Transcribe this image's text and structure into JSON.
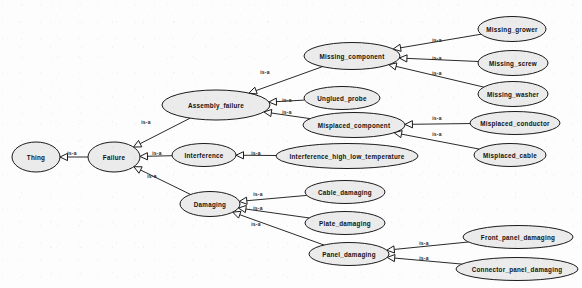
{
  "diagram": {
    "type": "is-a hierarchy graph",
    "background_color": "#fdfdfd",
    "node_fill_color": "#ebebeb",
    "node_stroke_color": "#1b1b1b",
    "edge_color": "#2a2a2a",
    "edge_label_text": "is-a",
    "nodes": [
      {
        "id": "thing",
        "label": "Thing",
        "cx": 36,
        "cy": 157,
        "rx": 24,
        "ry": 15
      },
      {
        "id": "failure",
        "label": "Failure",
        "cx": 114,
        "cy": 157,
        "rx": 26,
        "ry": 15
      },
      {
        "id": "assembly_failure",
        "label": "Assembly_failure",
        "cx": 216,
        "cy": 105,
        "rx": 54,
        "ry": 15
      },
      {
        "id": "interference",
        "label": "Interference",
        "cx": 204,
        "cy": 155,
        "rx": 32,
        "ry": 11.5
      },
      {
        "id": "damaging",
        "label": "Damaging",
        "cx": 210,
        "cy": 204,
        "rx": 30,
        "ry": 12.5
      },
      {
        "id": "missing_component",
        "label": "Missing_component",
        "cx": 352,
        "cy": 56,
        "rx": 48,
        "ry": 13.5
      },
      {
        "id": "unglued_probe",
        "label": "Unglued_probe",
        "cx": 342,
        "cy": 98,
        "rx": 38,
        "ry": 11.5
      },
      {
        "id": "misplaced_component",
        "label": "Misplaced_component",
        "cx": 354,
        "cy": 125,
        "rx": 51,
        "ry": 12.5
      },
      {
        "id": "interference_hlt",
        "label": "Interference_high_low_temperature",
        "cx": 347,
        "cy": 156,
        "rx": 71,
        "ry": 12.5
      },
      {
        "id": "cable_damaging",
        "label": "Cable_damaging",
        "cx": 345,
        "cy": 192,
        "rx": 40,
        "ry": 11.5
      },
      {
        "id": "plate_damaging",
        "label": "Plate_damaging",
        "cx": 345,
        "cy": 223,
        "rx": 40,
        "ry": 11.5
      },
      {
        "id": "panel_damaging",
        "label": "Panel_damaging",
        "cx": 349,
        "cy": 254,
        "rx": 40,
        "ry": 11.5
      },
      {
        "id": "missing_grower",
        "label": "Missing_grower",
        "cx": 512,
        "cy": 29,
        "rx": 34,
        "ry": 12.5
      },
      {
        "id": "missing_screw",
        "label": "Missing_screw",
        "cx": 513,
        "cy": 63,
        "rx": 35,
        "ry": 12.5
      },
      {
        "id": "missing_washer",
        "label": "Missing_washer",
        "cx": 513,
        "cy": 94,
        "rx": 35,
        "ry": 12.5
      },
      {
        "id": "misplaced_conductor",
        "label": "Misplaced_conductor",
        "cx": 515,
        "cy": 123,
        "rx": 45,
        "ry": 11.5
      },
      {
        "id": "misplaced_cable",
        "label": "Misplaced_cable",
        "cx": 510,
        "cy": 155,
        "rx": 36,
        "ry": 11.5
      },
      {
        "id": "front_panel_damaging",
        "label": "Front_panel_damaging",
        "cx": 518,
        "cy": 237,
        "rx": 55,
        "ry": 11.5
      },
      {
        "id": "connector_panel_damaging",
        "label": "Connector_panel_damaging",
        "cx": 517,
        "cy": 269,
        "rx": 61,
        "ry": 11.5
      }
    ],
    "edges": [
      {
        "from": "failure",
        "to": "thing",
        "label": "is-a",
        "lx": 72,
        "ly": 153
      },
      {
        "from": "assembly_failure",
        "to": "failure",
        "label": "is-a",
        "lx": 146,
        "ly": 122
      },
      {
        "from": "interference",
        "to": "failure",
        "label": "is-a",
        "lx": 157,
        "ly": 153
      },
      {
        "from": "damaging",
        "to": "failure",
        "label": "is-a",
        "lx": 152,
        "ly": 176
      },
      {
        "from": "missing_component",
        "to": "assembly_failure",
        "label": "is-a",
        "lx": 265,
        "ly": 72
      },
      {
        "from": "unglued_probe",
        "to": "assembly_failure",
        "label": "is-a",
        "lx": 287,
        "ly": 100
      },
      {
        "from": "misplaced_component",
        "to": "assembly_failure",
        "label": "is-a",
        "lx": 287,
        "ly": 112
      },
      {
        "from": "interference_hlt",
        "to": "interference",
        "label": "is-a",
        "lx": 256,
        "ly": 153
      },
      {
        "from": "missing_grower",
        "to": "missing_component",
        "label": "is-a",
        "lx": 437,
        "ly": 40
      },
      {
        "from": "missing_screw",
        "to": "missing_component",
        "label": "is-a",
        "lx": 437,
        "ly": 58
      },
      {
        "from": "missing_washer",
        "to": "missing_component",
        "label": "is-a",
        "lx": 437,
        "ly": 73
      },
      {
        "from": "misplaced_conductor",
        "to": "misplaced_component",
        "label": "is-a",
        "lx": 437,
        "ly": 118
      },
      {
        "from": "misplaced_cable",
        "to": "misplaced_component",
        "label": "is-a",
        "lx": 437,
        "ly": 134
      },
      {
        "from": "cable_damaging",
        "to": "damaging",
        "label": "is-a",
        "lx": 258,
        "ly": 194
      },
      {
        "from": "plate_damaging",
        "to": "damaging",
        "label": "is-a",
        "lx": 258,
        "ly": 208
      },
      {
        "from": "panel_damaging",
        "to": "damaging",
        "label": "is-a",
        "lx": 256,
        "ly": 224
      },
      {
        "from": "front_panel_damaging",
        "to": "panel_damaging",
        "label": "is-a",
        "lx": 424,
        "ly": 243
      },
      {
        "from": "connector_panel_damaging",
        "to": "panel_damaging",
        "label": "is-a",
        "lx": 424,
        "ly": 258
      }
    ]
  }
}
